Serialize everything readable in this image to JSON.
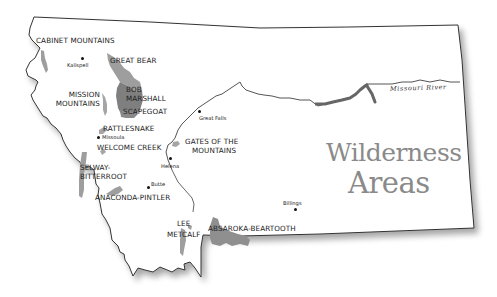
{
  "map": {
    "title_line1": "Wilderness",
    "title_line2": "Areas",
    "colors": {
      "wilderness_light": "#9e9e9e",
      "wilderness_dark": "#7a7a7a",
      "river": "#555555",
      "outline": "#333333",
      "title": "#8a8a8a"
    },
    "river": {
      "label": "Missouri River"
    },
    "wilderness_areas": [
      {
        "id": "cabinet",
        "label": "CABINET MOUNTAINS"
      },
      {
        "id": "great-bear",
        "label": "GREAT BEAR"
      },
      {
        "id": "bob-marshall",
        "label_line1": "BOB",
        "label_line2": "MARSHALL"
      },
      {
        "id": "scapegoat",
        "label": "SCAPEGOAT"
      },
      {
        "id": "mission",
        "label_line1": "MISSION",
        "label_line2": "MOUNTAINS"
      },
      {
        "id": "rattlesnake",
        "label": "RATTLESNAKE"
      },
      {
        "id": "welcome-creek",
        "label": "WELCOME CREEK"
      },
      {
        "id": "selway",
        "label_line1": "SELWAY-",
        "label_line2": "BITTERROOT"
      },
      {
        "id": "anaconda",
        "label": "ANACONDA-PINTLER"
      },
      {
        "id": "gates",
        "label_line1": "GATES OF THE",
        "label_line2": "MOUNTAINS"
      },
      {
        "id": "lee-metcalf",
        "label_line1": "LEE",
        "label_line2": "METCALF"
      },
      {
        "id": "absaroka",
        "label": "ABSAROKA-BEARTOOTH"
      }
    ],
    "cities": [
      {
        "id": "kalispell",
        "label": "Kalispell"
      },
      {
        "id": "missoula",
        "label": "Missoula"
      },
      {
        "id": "great-falls",
        "label": "Great Falls"
      },
      {
        "id": "helena",
        "label": "Helena"
      },
      {
        "id": "butte",
        "label": "Butte"
      },
      {
        "id": "billings",
        "label": "Billings"
      }
    ]
  }
}
